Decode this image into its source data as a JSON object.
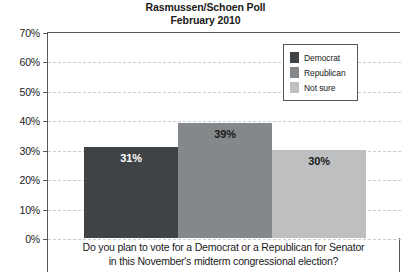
{
  "chart_data": {
    "type": "bar",
    "title": "Rasmussen/Schoen Poll",
    "subtitle": "February 2010",
    "title_lines": [
      "Rasmussen/Schoen Poll",
      "February 2010"
    ],
    "caption": "Do you plan to vote for a Democrat or a Republican for Senator in this November's midterm congressional election?",
    "caption_lines": [
      "Do you plan to vote for a Democrat or a Republican for Senator",
      "in this November's midterm congressional election?"
    ],
    "categories": [
      "Democrat",
      "Republican",
      "Not sure"
    ],
    "values": [
      31,
      39,
      30
    ],
    "value_labels": [
      "31%",
      "39%",
      "30%"
    ],
    "bar_colors": [
      "#404346",
      "#85888b",
      "#bdbfc1"
    ],
    "bar_label_colors": [
      "#ffffff",
      "#1a1a1a",
      "#1a1a1a"
    ],
    "xlabel": "",
    "ylabel": "",
    "ylim": [
      0,
      70
    ],
    "ytick_values": [
      0,
      10,
      20,
      30,
      40,
      50,
      60,
      70
    ],
    "ytick_labels": [
      "0%",
      "10%",
      "20%",
      "30%",
      "40%",
      "50%",
      "60%",
      "70%"
    ],
    "grid": true,
    "grid_color": "#c9ccd0",
    "axis_color": "#55585c",
    "legend_position": "top-right",
    "legend": [
      {
        "label": "Democrat",
        "color": "#404346"
      },
      {
        "label": "Republican",
        "color": "#85888b"
      },
      {
        "label": "Not sure",
        "color": "#bdbfc1"
      }
    ]
  }
}
